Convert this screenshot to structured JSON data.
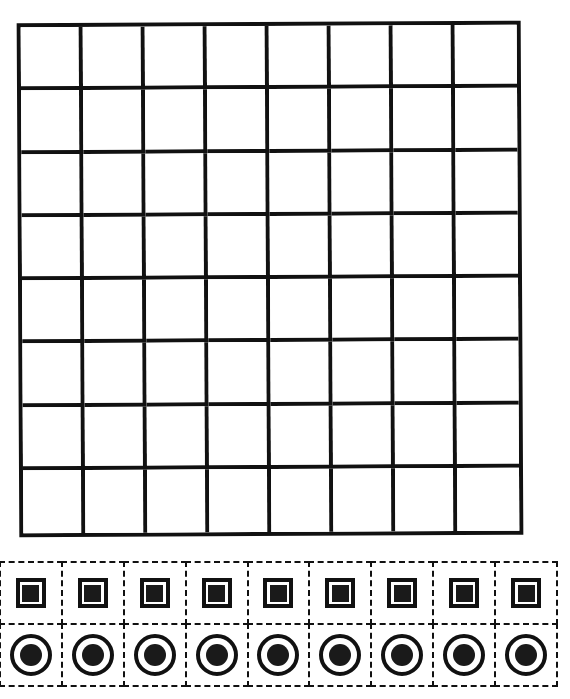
{
  "board": {
    "rows": 8,
    "cols": 8,
    "line_color": "#111111",
    "cell_color": "#ffffff"
  },
  "tray": {
    "columns": 9,
    "rows": [
      {
        "piece": "square",
        "count": 9
      },
      {
        "piece": "circle",
        "count": 9
      }
    ],
    "slot_border": "dashed",
    "piece_color": "#1a1a1a"
  }
}
